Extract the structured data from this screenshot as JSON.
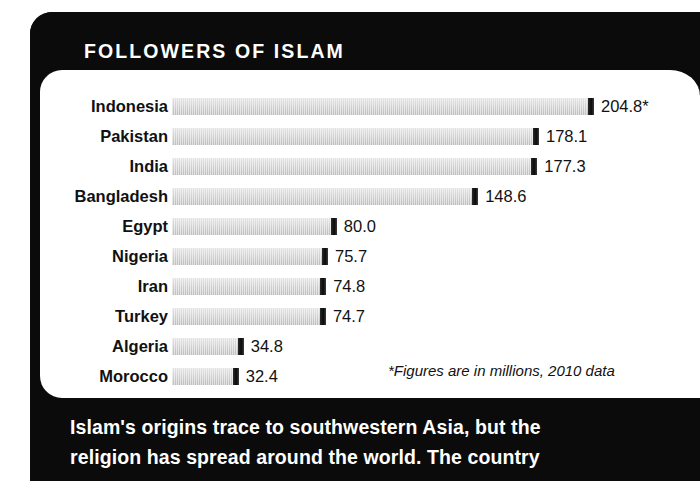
{
  "title": "FOLLOWERS OF ISLAM",
  "footnote": "*Figures are in millions, 2010 data",
  "caption": {
    "line1": "Islam's origins trace to southwestern Asia, but the",
    "line2": "religion has spread around the world. The country"
  },
  "colors": {
    "panel_background": "#0b0b0b",
    "chart_background": "#ffffff",
    "bar_fill": "#d3d3d3",
    "bar_cap": "#0b0b0b",
    "title_text": "#ffffff",
    "label_text": "#111111"
  },
  "chart_data": {
    "type": "bar",
    "orientation": "horizontal",
    "title": "FOLLOWERS OF ISLAM",
    "xlabel": "",
    "ylabel": "",
    "units": "millions",
    "year": "2010",
    "grid": false,
    "legend": false,
    "xlim": [
      0,
      204.8
    ],
    "categories": [
      "Indonesia",
      "Pakistan",
      "India",
      "Bangladesh",
      "Egypt",
      "Nigeria",
      "Iran",
      "Turkey",
      "Algeria",
      "Morocco"
    ],
    "values": [
      204.8,
      178.1,
      177.3,
      148.6,
      80.0,
      75.7,
      74.8,
      74.7,
      34.8,
      32.4
    ],
    "value_labels": [
      "204.8*",
      "178.1",
      "177.3",
      "148.6",
      "80.0",
      "75.7",
      "74.8",
      "74.7",
      "34.8",
      "32.4"
    ],
    "annotations": [
      "*Figures are in millions, 2010 data"
    ]
  }
}
